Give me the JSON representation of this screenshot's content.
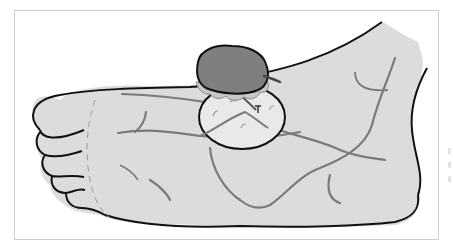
{
  "figure": {
    "colors": {
      "background": "#ffffff",
      "frame_border": "#cfcfcf",
      "skin_fill": "#dcdcdc",
      "outline": "#111111",
      "vein": "#7a7a7a",
      "mass_fill": "#7f7f7f",
      "base_fill": "#e9e9e9",
      "fringe_fill": "#c8c8c8"
    },
    "elements": [
      "foot-outline",
      "toes",
      "veins",
      "raised-mass",
      "lesion-base-circle"
    ]
  }
}
